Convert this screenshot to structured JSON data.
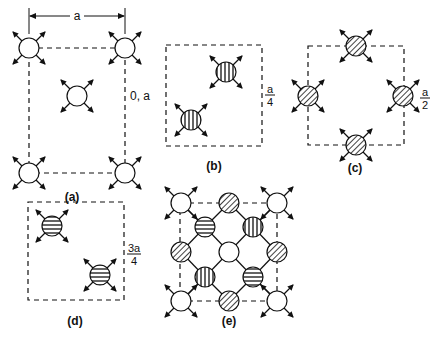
{
  "figure": {
    "panels": [
      {
        "id": "a",
        "label": "(a)",
        "layer_label": "0, a",
        "dimension_label": "a",
        "atom_fill": "open",
        "atoms": [
          "corner-top-left",
          "corner-top-right",
          "face-center",
          "corner-bottom-left",
          "corner-bottom-right"
        ]
      },
      {
        "id": "b",
        "label": "(b)",
        "layer_label_num": "a",
        "layer_label_den": "4",
        "atom_fill": "vertical-stripes",
        "atoms": [
          "upper-right",
          "lower-left"
        ]
      },
      {
        "id": "c",
        "label": "(c)",
        "layer_label_num": "a",
        "layer_label_den": "2",
        "atom_fill": "diagonal-hatch",
        "atoms": [
          "edge-top",
          "edge-left",
          "edge-right",
          "edge-bottom"
        ]
      },
      {
        "id": "d",
        "label": "(d)",
        "layer_label_num": "3a",
        "layer_label_den": "4",
        "atom_fill": "horizontal-stripes",
        "atoms": [
          "upper-left",
          "lower-right"
        ]
      },
      {
        "id": "e",
        "label": "(e)",
        "description": "combined projection of all layers with bonds",
        "atom_fills": [
          "open",
          "diagonal-hatch",
          "horizontal-stripes",
          "vertical-stripes"
        ]
      }
    ],
    "colors": {
      "ink": "#111111",
      "background": "#ffffff"
    }
  }
}
